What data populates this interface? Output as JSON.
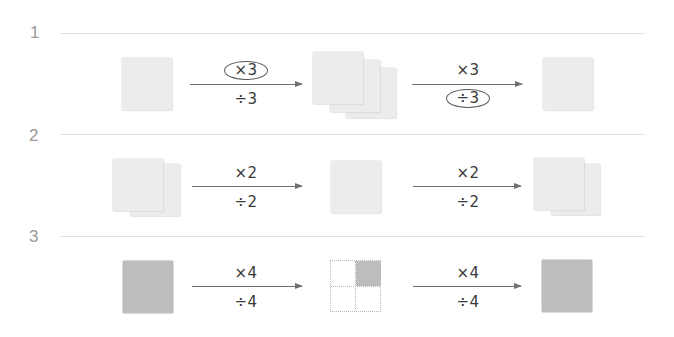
{
  "colors": {
    "light_square": "#ececec",
    "dark_square": "#bdbdbd",
    "arrow": "#707070",
    "row_number": "#9a9a9a",
    "divider": "#e2e2e2"
  },
  "rows": [
    {
      "number": "1",
      "shapes": [
        "1 light square",
        "3 stacked light squares",
        "1 light square"
      ],
      "arrow1": {
        "top": "×3",
        "bottom": "÷3",
        "circled": "top"
      },
      "arrow2": {
        "top": "×3",
        "bottom": "÷3",
        "circled": "bottom"
      }
    },
    {
      "number": "2",
      "shapes": [
        "2 stacked light squares",
        "1 light square",
        "2 stacked light squares"
      ],
      "arrow1": {
        "top": "×2",
        "bottom": "÷2",
        "circled": "none"
      },
      "arrow2": {
        "top": "×2",
        "bottom": "÷2",
        "circled": "none"
      }
    },
    {
      "number": "3",
      "shapes": [
        "1 dark square",
        "2x2 dotted grid with top-right quarter shaded",
        "1 dark square"
      ],
      "arrow1": {
        "top": "×4",
        "bottom": "÷4",
        "circled": "none"
      },
      "arrow2": {
        "top": "×4",
        "bottom": "÷4",
        "circled": "none"
      }
    }
  ]
}
